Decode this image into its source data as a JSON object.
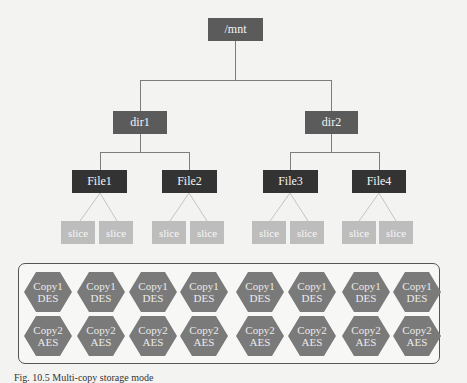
{
  "tree": {
    "root": {
      "label": "/mnt"
    },
    "dirs": [
      {
        "label": "dir1"
      },
      {
        "label": "dir2"
      }
    ],
    "files": [
      {
        "label": "File1",
        "slices": [
          "slice",
          "slice"
        ]
      },
      {
        "label": "File2",
        "slices": [
          "slice",
          "slice"
        ]
      },
      {
        "label": "File3",
        "slices": [
          "slice",
          "slice"
        ]
      },
      {
        "label": "File4",
        "slices": [
          "slice",
          "slice"
        ]
      }
    ]
  },
  "storage": {
    "row1": [
      {
        "line1": "Copy1",
        "line2": "DES"
      },
      {
        "line1": "Copy1",
        "line2": "DES"
      },
      {
        "line1": "Copy1",
        "line2": "DES"
      },
      {
        "line1": "Copy1",
        "line2": "DES"
      },
      {
        "line1": "Copy1",
        "line2": "DES"
      },
      {
        "line1": "Copy1",
        "line2": "DES"
      },
      {
        "line1": "Copy1",
        "line2": "DES"
      },
      {
        "line1": "Copy1",
        "line2": "DES"
      }
    ],
    "row2": [
      {
        "line1": "Copy2",
        "line2": "AES"
      },
      {
        "line1": "Copy2",
        "line2": "AES"
      },
      {
        "line1": "Copy2",
        "line2": "AES"
      },
      {
        "line1": "Copy2",
        "line2": "AES"
      },
      {
        "line1": "Copy2",
        "line2": "AES"
      },
      {
        "line1": "Copy2",
        "line2": "AES"
      },
      {
        "line1": "Copy2",
        "line2": "AES"
      },
      {
        "line1": "Copy2",
        "line2": "AES"
      }
    ]
  },
  "caption": {
    "text": "Fig. 10.5  Multi-copy storage mode"
  },
  "colors": {
    "root_dir": "#5b5b5b",
    "file": "#333333",
    "slice": "#bdbdbd",
    "hexagon": "#7a7a7a",
    "connector": "#888888"
  }
}
